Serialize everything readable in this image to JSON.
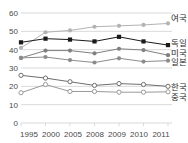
{
  "chart_data": {
    "type": "line",
    "title": "",
    "subtitle": "",
    "xlabel": "",
    "ylabel": "",
    "grid": true,
    "legend_position": "right-inline",
    "x": [
      "1995",
      "2000",
      "2005",
      "2008",
      "2009",
      "2010",
      "2011"
    ],
    "xtick_labels": [
      "1995",
      "2000",
      "2005",
      "2008",
      "2009",
      "2010",
      "2011"
    ],
    "ytick_labels": [
      "0",
      "10",
      "20",
      "30",
      "40",
      "50",
      "60"
    ],
    "yticks": [
      0,
      10,
      20,
      30,
      40,
      50,
      60
    ],
    "ylim": [
      0,
      62
    ],
    "series": [
      {
        "name": "여국",
        "label": "여국",
        "color": "#b3b3b3",
        "marker": "filled-circle",
        "values": [
          41,
          49.5,
          50.5,
          52.5,
          53,
          53.5,
          54.3
        ]
      },
      {
        "name": "독일",
        "label": "독일",
        "color": "#1a1a1a",
        "marker": "filled-square",
        "values": [
          44,
          46,
          45.5,
          44.5,
          47,
          44.5,
          42.5
        ]
      },
      {
        "name": "미국",
        "label": "미국",
        "color": "#808080",
        "marker": "filled-circle",
        "values": [
          35.5,
          39.5,
          39.5,
          38,
          40.5,
          39.8,
          37
        ]
      },
      {
        "name": "일본",
        "label": "일본",
        "color": "#8c8c8c",
        "marker": "filled-circle",
        "values": [
          35.5,
          36,
          34.3,
          33,
          35.3,
          33.5,
          34
        ]
      },
      {
        "name": "한국",
        "label": "한국",
        "color": "#6e6e6e",
        "marker": "open-circle",
        "values": [
          26,
          24.5,
          22.5,
          20.5,
          21.5,
          21,
          20
        ]
      },
      {
        "name": "중국",
        "label": "중국",
        "color": "#9a9a9a",
        "marker": "open-circle",
        "values": [
          16.5,
          21,
          17.2,
          17.2,
          16.8,
          16.8,
          17
        ]
      }
    ]
  },
  "axis": {
    "y": {
      "t60": "60",
      "t50": "50",
      "t40": "40",
      "t30": "30",
      "t20": "20",
      "t10": "10",
      "t0": "0"
    },
    "x": {
      "t1995": "1995",
      "t2000": "2000",
      "t2005": "2005",
      "t2008": "2008",
      "t2009": "2009",
      "t2010": "2010",
      "t2011": "2011"
    }
  },
  "labels": {
    "uk": "여국",
    "germany": "독일",
    "usa": "미국",
    "japan": "일본",
    "korea": "한국",
    "china": "중국"
  },
  "colors": {
    "grid": "#d9d9d9",
    "axis_text": "#4a4a4a",
    "label_text": "#2b2b2b",
    "background": "#ffffff"
  }
}
